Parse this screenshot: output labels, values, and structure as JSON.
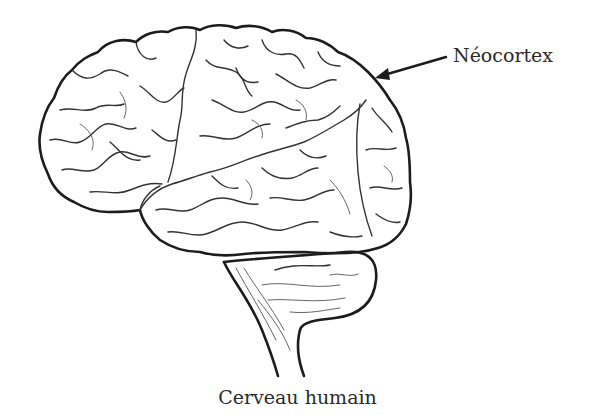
{
  "diagram": {
    "labels": [
      {
        "id": "neocortex",
        "text": "Néocortex",
        "points_to": "cortex cérébral"
      }
    ],
    "caption": "Cerveau humain",
    "colors": {
      "line": "#1c1c1c",
      "text": "#2a2a2a",
      "background": "#ffffff"
    }
  }
}
